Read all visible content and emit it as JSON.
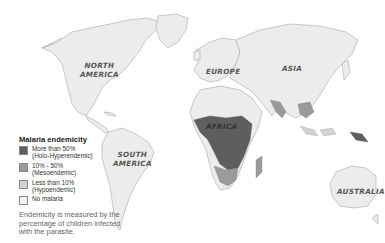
{
  "map": {
    "continent_labels": {
      "north_america": [
        "NORTH",
        "AMERICA"
      ],
      "south_america": [
        "SOUTH",
        "AMERICA"
      ],
      "europe": "EUROPE",
      "asia": "ASIA",
      "africa": "AFRICA",
      "australia": "AUSTRALIA"
    }
  },
  "legend": {
    "title": "Malaria endemicity",
    "items": [
      {
        "line1": "More than 50%",
        "line2": "(Holo-Hyperendemic)",
        "color": "#5e5e5e"
      },
      {
        "line1": "10% - 50%",
        "line2": "(Mesoendemic)",
        "color": "#9a9a9a"
      },
      {
        "line1": "Less than 10%",
        "line2": "(Hypoendemic)",
        "color": "#d2d2d2"
      },
      {
        "line1": "No malaria",
        "line2": "",
        "color": "#f2f2f2"
      }
    ]
  },
  "note": "Endemicity is measured by the percentage of children infected with the parasite."
}
